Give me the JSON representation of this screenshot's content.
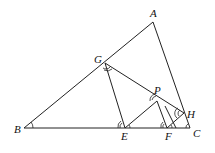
{
  "diagram": {
    "points": {
      "A": {
        "label": "A",
        "x": 153,
        "y": 22
      },
      "B": {
        "label": "B",
        "x": 24,
        "y": 128
      },
      "C": {
        "label": "C",
        "x": 190,
        "y": 128
      },
      "G": {
        "label": "G",
        "x": 105,
        "y": 63
      },
      "E": {
        "label": "E",
        "x": 125,
        "y": 128
      },
      "P": {
        "label": "P",
        "x": 155,
        "y": 98
      },
      "F": {
        "label": "F",
        "x": 168,
        "y": 128
      },
      "H": {
        "label": "H",
        "x": 182,
        "y": 112
      }
    },
    "segments": [
      "AB",
      "BC",
      "CA",
      "GH",
      "GE",
      "EP",
      "PF",
      "FH"
    ],
    "angle_marks": [
      "B",
      "G",
      "E",
      "P",
      "F",
      "H",
      "C"
    ]
  }
}
